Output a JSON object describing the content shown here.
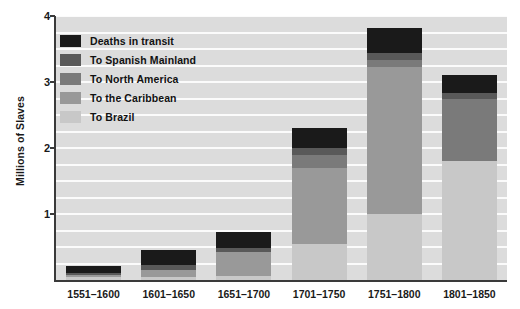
{
  "chart_data": {
    "type": "bar",
    "stacked": true,
    "title": "",
    "xlabel": "",
    "ylabel": "Millions of Slaves",
    "ylim": [
      0,
      4
    ],
    "yticks": [
      1,
      2,
      3,
      4
    ],
    "ytick_labels": [
      "1",
      "2",
      "3",
      "4"
    ],
    "grid": true,
    "grid_interval": 0.25,
    "legend_position": "top-left inside plot",
    "categories": [
      "1551-1600",
      "1601-1650",
      "1651-1700",
      "1701-1750",
      "1751-1800",
      "1801-1850"
    ],
    "series": [
      {
        "name": "To Brazil",
        "color": "#c8c8c8",
        "values": [
          0.05,
          0.05,
          0.06,
          0.55,
          1.0,
          1.8
        ]
      },
      {
        "name": "To the Caribbean",
        "color": "#999999",
        "values": [
          0.02,
          0.1,
          0.37,
          1.15,
          2.22,
          0.0
        ]
      },
      {
        "name": "To North America",
        "color": "#7a7a7a",
        "values": [
          0.0,
          0.0,
          0.0,
          0.2,
          0.12,
          0.95
        ]
      },
      {
        "name": "To Spanish Mainland",
        "color": "#595959",
        "values": [
          0.03,
          0.08,
          0.05,
          0.1,
          0.1,
          0.08
        ]
      },
      {
        "name": "Deaths in transit",
        "color": "#1a1a1a",
        "values": [
          0.12,
          0.22,
          0.25,
          0.3,
          0.38,
          0.28
        ]
      }
    ],
    "totals": [
      0.22,
      0.45,
      0.73,
      2.3,
      3.82,
      3.11
    ]
  },
  "legend": {
    "items": [
      {
        "label": "Deaths in transit",
        "color": "#1a1a1a"
      },
      {
        "label": "To Spanish Mainland",
        "color": "#595959"
      },
      {
        "label": "To North America",
        "color": "#7a7a7a"
      },
      {
        "label": "To the Caribbean",
        "color": "#999999"
      },
      {
        "label": "To Brazil",
        "color": "#c8c8c8"
      }
    ]
  },
  "colors": {
    "plot_background": "#dcdcdc",
    "gridline": "#fbfbfb",
    "axis": "#3a3a3a",
    "text": "#1a1a1a",
    "page_background": "#ffffff"
  }
}
